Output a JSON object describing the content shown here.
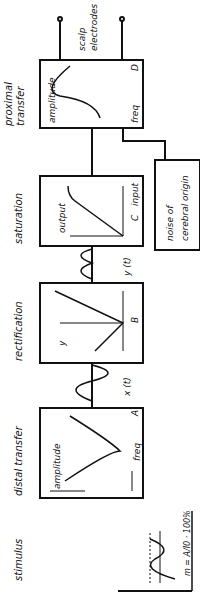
{
  "stages": [
    {
      "id": "stimulus",
      "title": "stimulus",
      "labels": {
        "y": "I",
        "baseline": "I0",
        "mod_label": "A",
        "formula": "m = A/I0 · 100%",
        "x": "t"
      }
    },
    {
      "id": "distal",
      "title": "distal transfer",
      "labels": {
        "y": "amplitude",
        "x": "freq",
        "low": "6db",
        "high": "18db",
        "letter": "A"
      }
    },
    {
      "id": "rectification",
      "title": "rectification",
      "labels": {
        "y": "y",
        "x": "x",
        "plus": "+",
        "minus": "-",
        "letter": "B"
      }
    },
    {
      "id": "saturation",
      "title": "saturation",
      "labels": {
        "y": "output",
        "x": "input",
        "letter": "C"
      }
    },
    {
      "id": "proximal",
      "title_line1": "proximal",
      "title_line2": "transfer",
      "labels": {
        "y": "amplitude",
        "x": "freq",
        "letter": "D"
      }
    }
  ],
  "signals": {
    "x": "x (t)",
    "y": "y (t)"
  },
  "noise": {
    "line1": "noise of",
    "line2": "cerebral origin"
  },
  "output": {
    "line1": "scalp",
    "line2": "electrodes"
  }
}
